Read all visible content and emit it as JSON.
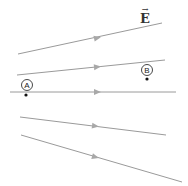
{
  "field": {
    "label": "E",
    "vector_arrow": "→",
    "line_color": "#9a9a9a",
    "arrow_color": "#a8a8a8",
    "lines": [
      {
        "x1": 18,
        "y1": 54,
        "x2": 162,
        "y2": 23,
        "ax": 97,
        "ay": 38
      },
      {
        "x1": 17,
        "y1": 75,
        "x2": 165,
        "y2": 60,
        "ax": 97,
        "ay": 67
      },
      {
        "x1": 10,
        "y1": 92,
        "x2": 176,
        "y2": 92,
        "ax": 97,
        "ay": 92
      },
      {
        "x1": 20,
        "y1": 117,
        "x2": 166,
        "y2": 135,
        "ax": 95,
        "ay": 126
      },
      {
        "x1": 21,
        "y1": 135,
        "x2": 182,
        "y2": 182,
        "ax": 95,
        "ay": 157
      }
    ]
  },
  "points": [
    {
      "label": "A",
      "cx": 27,
      "cy": 85,
      "dot_x": 26,
      "dot_y": 95
    },
    {
      "label": "B",
      "cx": 147,
      "cy": 70,
      "dot_x": 147,
      "dot_y": 79
    }
  ]
}
